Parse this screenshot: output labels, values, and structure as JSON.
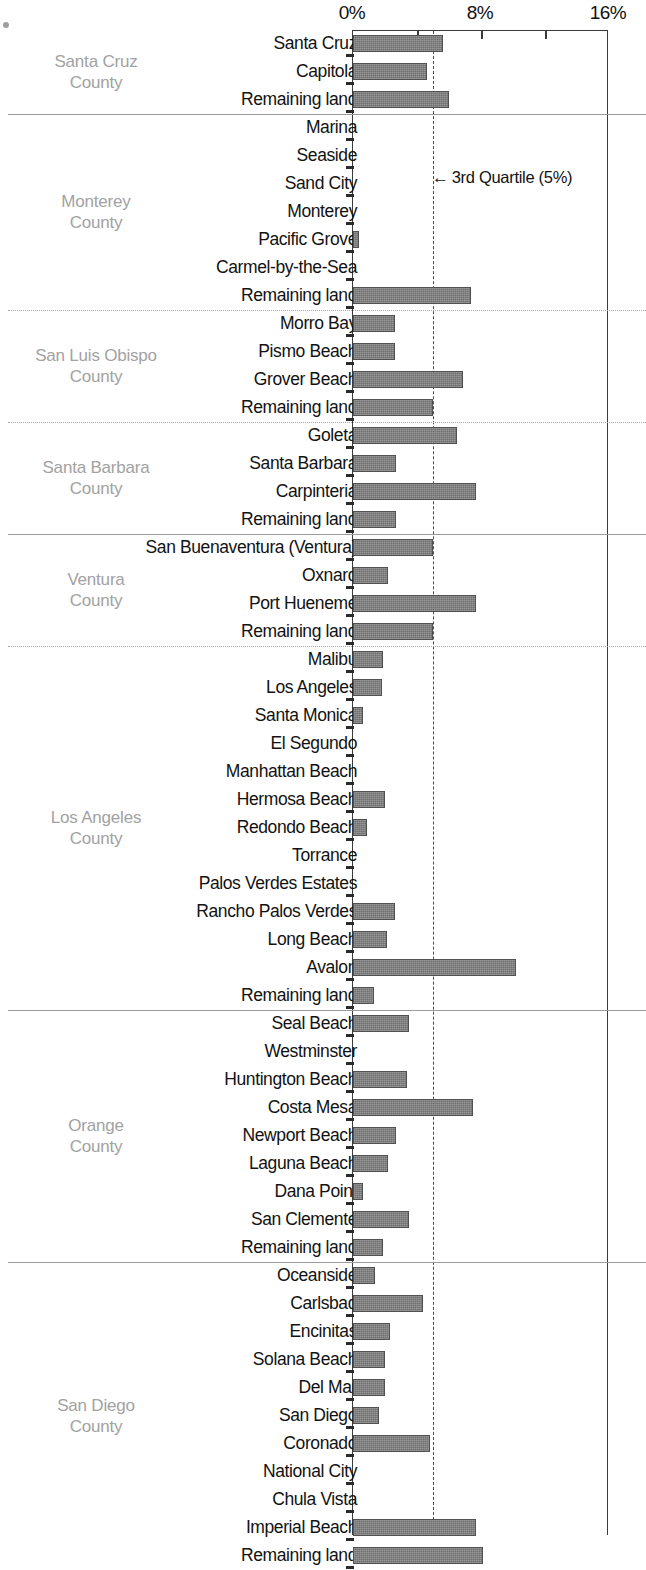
{
  "chart_data": {
    "type": "bar",
    "orientation": "horizontal",
    "title": "",
    "xlabel": "",
    "ylabel": "",
    "xlim": [
      0,
      16
    ],
    "xunit": "%",
    "xticks": [
      0,
      8,
      16
    ],
    "xtick_labels": [
      "0%",
      "8%",
      "16%"
    ],
    "minor_xticks": [
      4,
      8,
      12
    ],
    "grid": false,
    "legend": false,
    "bar_color": "#6f6f6f",
    "annotations": [
      {
        "text": "← 3rd Quartile (5%)",
        "label": "3rd Quartile (5%)",
        "value": 5,
        "type": "reference-line",
        "style": "dashed"
      }
    ],
    "groups": [
      {
        "name": "Santa Cruz County",
        "name_lines": [
          "Santa Cruz",
          "County"
        ],
        "categories": [
          "Santa Cruz",
          "Capitola",
          "Remaining land"
        ],
        "values": [
          5.6,
          4.6,
          6.0
        ]
      },
      {
        "name": "Monterey County",
        "name_lines": [
          "Monterey",
          "County"
        ],
        "categories": [
          "Marina",
          "Seaside",
          "Sand City",
          "Monterey",
          "Pacific Grove",
          "Carmel-by-the-Sea",
          "Remaining land"
        ],
        "values": [
          0,
          0,
          0,
          0,
          0.35,
          0,
          7.4
        ]
      },
      {
        "name": "San Luis Obispo County",
        "name_lines": [
          "San Luis Obispo",
          "County"
        ],
        "categories": [
          "Morro Bay",
          "Pismo Beach",
          "Grover Beach",
          "Remaining land"
        ],
        "values": [
          2.6,
          2.6,
          6.9,
          5.0
        ]
      },
      {
        "name": "Santa Barbara County",
        "name_lines": [
          "Santa Barbara",
          "County"
        ],
        "categories": [
          "Goleta",
          "Santa Barbara",
          "Carpinteria",
          "Remaining land"
        ],
        "values": [
          6.5,
          2.7,
          7.7,
          2.7
        ]
      },
      {
        "name": "Ventura County",
        "name_lines": [
          "Ventura",
          "County"
        ],
        "categories": [
          "San Buenaventura (Ventura)",
          "Oxnard",
          "Port Hueneme",
          "Remaining land"
        ],
        "values": [
          5.0,
          2.2,
          7.7,
          5.0
        ]
      },
      {
        "name": "Los Angeles County",
        "name_lines": [
          "Los Angeles",
          "County"
        ],
        "categories": [
          "Malibu",
          "Los Angeles",
          "Santa Monica",
          "El Segundo",
          "Manhattan Beach",
          "Hermosa Beach",
          "Redondo Beach",
          "Torrance",
          "Palos Verdes Estates",
          "Rancho Palos Verdes",
          "Long Beach",
          "Avalon",
          "Remaining land"
        ],
        "values": [
          1.9,
          1.8,
          0.6,
          0,
          0,
          2.0,
          0.9,
          0,
          0,
          2.6,
          2.1,
          10.2,
          1.3
        ]
      },
      {
        "name": "Orange County",
        "name_lines": [
          "Orange",
          "County"
        ],
        "categories": [
          "Seal Beach",
          "Westminster",
          "Huntington Beach",
          "Costa Mesa",
          "Newport Beach",
          "Laguna Beach",
          "Dana Point",
          "San Clemente",
          "Remaining land"
        ],
        "values": [
          3.5,
          0,
          3.4,
          7.5,
          2.7,
          2.2,
          0.6,
          3.5,
          1.9
        ]
      },
      {
        "name": "San Diego County",
        "name_lines": [
          "San Diego",
          "County"
        ],
        "categories": [
          "Oceanside",
          "Carlsbad",
          "Encinitas",
          "Solana Beach",
          "Del Mar",
          "San Diego",
          "Coronado",
          "National City",
          "Chula Vista",
          "Imperial Beach",
          "Remaining land"
        ],
        "values": [
          1.4,
          4.4,
          2.3,
          2.0,
          2.0,
          1.6,
          4.8,
          0,
          0,
          7.7,
          8.1
        ]
      }
    ]
  }
}
